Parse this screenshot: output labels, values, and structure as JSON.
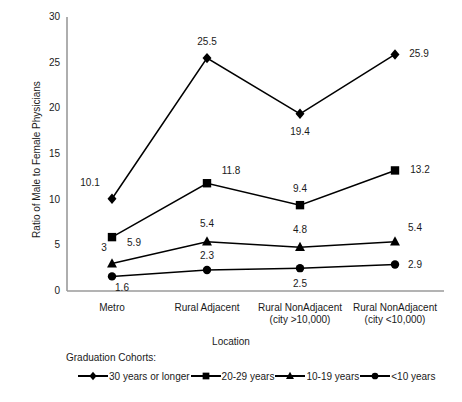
{
  "chart_data": {
    "type": "line",
    "title": "",
    "xlabel": "Location",
    "ylabel": "Ratio of Male to Female Physicians",
    "ylim": [
      0,
      30
    ],
    "yticks": [
      0,
      5,
      10,
      15,
      20,
      25,
      30
    ],
    "grid": false,
    "legend_position": "below",
    "legend_title": "Graduation Cohorts:",
    "categories": [
      "Metro",
      "Rural Adjacent",
      "Rural NonAdjacent (city >10,000)",
      "Rural NonAdjacent (city <10,000)"
    ],
    "category_lines": [
      [
        "Metro",
        ""
      ],
      [
        "Rural Adjacent",
        ""
      ],
      [
        "Rural NonAdjacent",
        "(city >10,000)"
      ],
      [
        "Rural NonAdjacent",
        "(city <10,000)"
      ]
    ],
    "series": [
      {
        "name": "30 years or longer",
        "marker": "diamond",
        "values": [
          10.1,
          25.5,
          19.4,
          25.9
        ],
        "labels": [
          "10.1",
          "25.5",
          "19.4",
          "25.9"
        ]
      },
      {
        "name": "20-29 years",
        "marker": "square",
        "values": [
          5.9,
          11.8,
          9.4,
          13.2
        ],
        "labels": [
          "5.9",
          "11.8",
          "9.4",
          "13.2"
        ]
      },
      {
        "name": "10-19 years",
        "marker": "triangle",
        "values": [
          3.0,
          5.4,
          4.8,
          5.4
        ],
        "labels": [
          "3",
          "5.4",
          "4.8",
          "5.4"
        ]
      },
      {
        "name": "<10 years",
        "marker": "circle",
        "values": [
          1.6,
          2.3,
          2.5,
          2.9
        ],
        "labels": [
          "1.6",
          "2.3",
          "2.5",
          "2.9"
        ]
      }
    ],
    "colors": {
      "line": "#000000",
      "marker": "#000000",
      "axis": "#888888",
      "text": "#1a1a1a",
      "background": "#ffffff"
    }
  }
}
